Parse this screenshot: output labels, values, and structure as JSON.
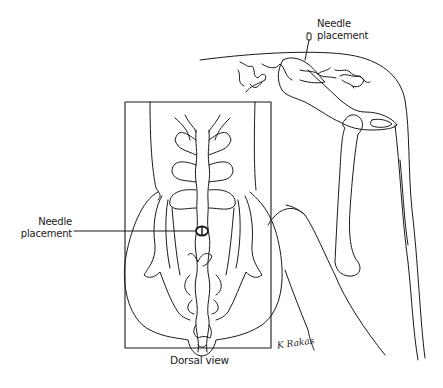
{
  "figure": {
    "type": "anatomical-line-illustration",
    "views": [
      "lateral",
      "dorsal"
    ],
    "labels": {
      "top_needle": "Needle\nplacement",
      "top_needle_line1": "Needle",
      "top_needle_line2": "placement",
      "left_needle_line1": "Needle",
      "left_needle_line2": "placement",
      "caption": "Dorsal view",
      "signature": "K Rakas"
    },
    "colors": {
      "stroke": "#1a1a1a",
      "background": "#ffffff"
    }
  }
}
